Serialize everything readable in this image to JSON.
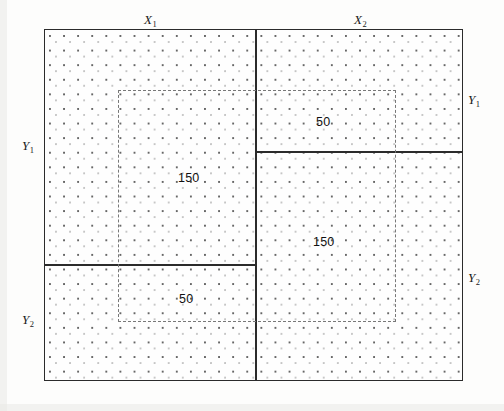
{
  "figure": {
    "type": "partition-diagram",
    "background_color": "#fdfdfc",
    "line_color": "#2b2b2b",
    "dashed_line_color": "#787878"
  },
  "axis_labels": {
    "x1": {
      "base": "X",
      "sub": "1"
    },
    "x2": {
      "base": "X",
      "sub": "2"
    },
    "y1_left": {
      "base": "Y",
      "sub": "1"
    },
    "y2_left": {
      "base": "Y",
      "sub": "2"
    },
    "y1_right": {
      "base": "Y",
      "sub": "1"
    },
    "y2_right": {
      "base": "Y",
      "sub": "2"
    }
  },
  "cell_values": {
    "top_right": "50",
    "top_left": "150",
    "bottom_right": "150",
    "bottom_left": "50"
  },
  "chart_data": {
    "type": "table",
    "title": "",
    "xlabel": "",
    "ylabel": "",
    "row_labels": [
      "Y1",
      "Y2"
    ],
    "column_labels": [
      "X1",
      "X2"
    ],
    "regions": [
      {
        "name": "X1-Y1",
        "column": "X1",
        "row": "Y1",
        "value": 150
      },
      {
        "name": "X2-Y1",
        "column": "X2",
        "row": "Y1",
        "value": 50
      },
      {
        "name": "X1-Y2",
        "column": "X1",
        "row": "Y2",
        "value": 50
      },
      {
        "name": "X2-Y2",
        "column": "X2",
        "row": "Y2",
        "value": 150
      }
    ],
    "values": [
      [
        150,
        50
      ],
      [
        50,
        150
      ]
    ]
  }
}
